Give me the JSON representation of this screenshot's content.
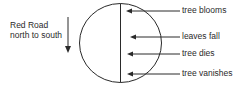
{
  "road": {
    "line1": "Red Road",
    "line2": "north to south",
    "direction_icon": "down-arrow-icon"
  },
  "events": [
    {
      "label": "tree blooms"
    },
    {
      "label": "leaves fall"
    },
    {
      "label": "tree dies"
    },
    {
      "label": "tree vanishes"
    }
  ],
  "colors": {
    "stroke": "#2a2a2a",
    "background": "#ffffff"
  }
}
